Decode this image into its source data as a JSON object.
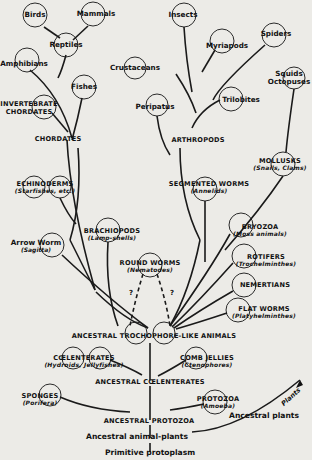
{
  "diagram": {
    "type": "evolutionary tree",
    "background": "#ecebe7",
    "ink": "#111111",
    "labels": {
      "birds": "Birds",
      "mammals": "Mammals",
      "reptiles": "Reptiles",
      "amphibians": "Amphibians",
      "fishes": "Fishes",
      "invertebrate_chordates_1": "INVERTEBRATE",
      "invertebrate_chordates_2": "CHORDATES",
      "chordates": "CHORDATES",
      "echinoderms": "ECHINODERMS",
      "echinoderms_sub": "(Starfishes, etc.)",
      "arrow_worm": "Arrow Worm",
      "arrow_worm_sub": "(Sagitta)",
      "brachiopods": "BRACHIOPODS",
      "brachiopods_sub": "(Lamp-shells)",
      "round_worms": "ROUND WORMS",
      "round_worms_sub": "(Nematodes)",
      "insects": "Insects",
      "myriapods": "Myriapods",
      "spiders": "Spiders",
      "crustaceans": "Crustaceans",
      "trilobites": "Trilobites",
      "peripatus": "Peripatus",
      "squids_1": "Squids",
      "squids_2": "Octopuses",
      "arthropods": "ARTHROPODS",
      "mollusks": "MOLLUSKS",
      "mollusks_sub": "(Snails, Clams)",
      "segmented_worms": "SEGMENTED WORMS",
      "segmented_worms_sub": "(Annelids)",
      "bryozoa": "BRYOZOA",
      "bryozoa_sub": "(Moss animals)",
      "rotifers": "ROTIFERS",
      "rotifers_sub": "(Trochelminthes)",
      "nemertians": "NEMERTIANS",
      "flat_worms": "FLAT WORMS",
      "flat_worms_sub": "(Platyhelminthes)",
      "trochophore": "ANCESTRAL TROCHOPHORE-LIKE ANIMALS",
      "coelenterates": "CŒLENTERATES",
      "coelenterates_sub": "(Hydroids, Jellyfishes)",
      "comb_jellies": "COMB JELLIES",
      "comb_jellies_sub": "(Ctenophores)",
      "ancestral_coelenterates": "ANCESTRAL CŒLENTERATES",
      "sponges": "SPONGES",
      "sponges_sub": "(Porifera)",
      "protozoa": "PROTOZOA",
      "protozoa_sub": "(Amoeba)",
      "ancestral_protozoa": "ANCESTRAL PROTOZOA",
      "ancestral_plants": "Ancestral plants",
      "plants_arrow": "Plants",
      "ancestral_animal_plants": "Ancestral animal-plants",
      "primitive_protoplasm": "Primitive protoplasm",
      "uncertain_mark": "?"
    }
  }
}
